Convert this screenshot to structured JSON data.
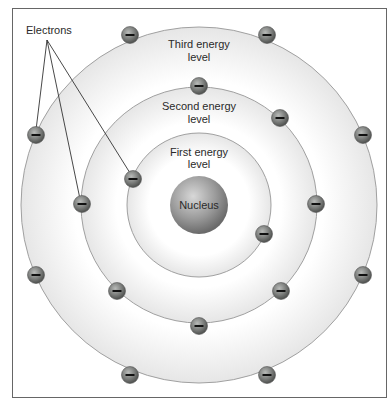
{
  "diagram": {
    "type": "atom-energy-levels",
    "callout": "Electrons",
    "nucleus_label": "Nucleus",
    "levels": [
      {
        "line1": "First energy",
        "line2": "level",
        "radius": 72
      },
      {
        "line1": "Second energy",
        "line2": "level",
        "radius": 118
      },
      {
        "line1": "Third energy",
        "line2": "level",
        "radius": 178
      }
    ],
    "electron_symbol": "−",
    "colors": {
      "ring_fill": "#f2f2f2",
      "ring_edge": "#9a9a9a",
      "electron": "#6f7270",
      "nucleus": "#8a8a8a",
      "frame": "#666666"
    }
  }
}
